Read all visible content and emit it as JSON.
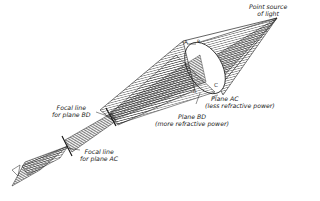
{
  "diagram": {
    "type": "ray-optics",
    "colors": {
      "ink": "#222222",
      "background": "#ffffff",
      "hatch": "#333333"
    },
    "labels": {
      "source_line1": "Point source",
      "source_line2": "of light",
      "point_a": "A",
      "point_b": "B",
      "point_c": "C",
      "point_d": "D",
      "plane_ac_line1": "Plane  AC",
      "plane_ac_line2": "(less refractive power)",
      "plane_bd_line1": "Plane  BD",
      "plane_bd_line2": "(more refractive power)",
      "focal_bd_line1": "Focal line",
      "focal_bd_line2": "for plane BD",
      "focal_ac_line1": "Focal line",
      "focal_ac_line2": "for plane AC"
    },
    "nodes": [
      {
        "id": "source",
        "label": "Point source of light"
      },
      {
        "id": "lens",
        "label": "Toric lens (A, B, C, D)"
      },
      {
        "id": "focal-bd",
        "label": "Focal line for plane BD"
      },
      {
        "id": "focal-ac",
        "label": "Focal line for plane AC"
      }
    ],
    "edges": [
      {
        "from": "source",
        "to": "lens"
      },
      {
        "from": "lens",
        "to": "focal-bd"
      },
      {
        "from": "focal-bd",
        "to": "focal-ac"
      }
    ]
  }
}
